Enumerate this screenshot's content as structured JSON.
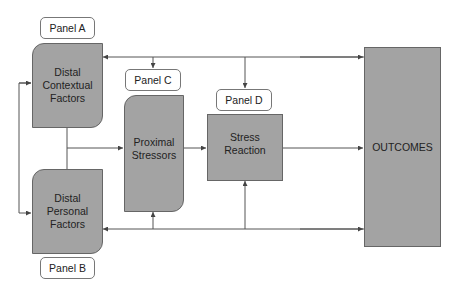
{
  "diagram": {
    "panels": {
      "a": "Panel A",
      "b": "Panel B",
      "c": "Panel C",
      "d": "Panel D"
    },
    "nodes": {
      "distal_contextual": "Distal Contextual Factors",
      "distal_personal": "Distal Personal Factors",
      "proximal_stressors": "Proximal Stressors",
      "stress_reaction": "Stress Reaction",
      "outcomes": "OUTCOMES"
    },
    "colors": {
      "box_fill": "#a3a3a3",
      "box_border": "#666666",
      "line": "#555555",
      "label_fill": "#ffffff"
    }
  }
}
